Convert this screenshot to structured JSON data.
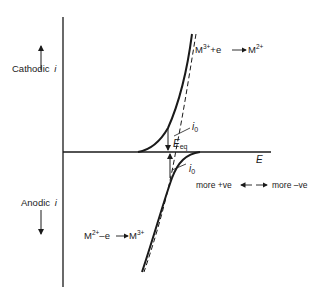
{
  "diagram": {
    "labels": {
      "cathodic": "Cathodic",
      "anodic": "Anodic",
      "current_symbol": "i",
      "potential_axis": "E",
      "equilibrium_potential": "E",
      "equilibrium_subscript": "eq",
      "exchange_current": "i",
      "exchange_subscript": "0",
      "more_positive": "more +ve",
      "more_negative": "more –ve"
    },
    "reactions": {
      "reduction": {
        "reactant": "M",
        "reactant_charge": "3+",
        "plus_electron": "+e",
        "product": "M",
        "product_charge": "2+"
      },
      "oxidation": {
        "reactant": "M",
        "reactant_charge": "2+",
        "minus_electron": "–e",
        "product": "M",
        "product_charge": "3+"
      }
    },
    "legend": {
      "solid_line": "net current",
      "dashed_line": "partial currents"
    },
    "colors": {
      "ink": "#1a1a1a",
      "background": "#ffffff"
    }
  }
}
